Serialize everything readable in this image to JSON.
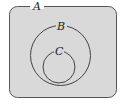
{
  "diagram": {
    "type": "euler-venn",
    "colors": {
      "fill": "#d9d9d9",
      "stroke": "#444444",
      "background": "#ffffff"
    },
    "sets": [
      {
        "id": "A",
        "label": "A",
        "shape": "rounded-rect",
        "contains": [
          "B"
        ]
      },
      {
        "id": "B",
        "label": "B",
        "shape": "circle",
        "contains": [
          "C"
        ]
      },
      {
        "id": "C",
        "label": "C",
        "shape": "circle",
        "contains": []
      }
    ]
  }
}
